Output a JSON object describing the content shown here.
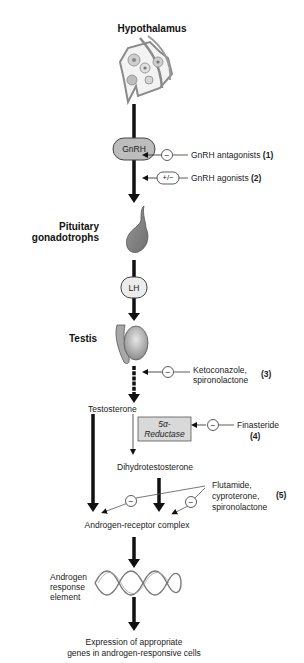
{
  "diagram": {
    "stages": {
      "hypothalamus": "Hypothalamus",
      "gnrh": "GnRH",
      "pituitary_line1": "Pituitary",
      "pituitary_line2": "gonadotrophs",
      "lh": "LH",
      "testis": "Testis",
      "testosterone": "Testosterone",
      "reductase_line1": "5α-",
      "reductase_line2": "Reductase",
      "dht": "Dihydrotestosterone",
      "arc": "Androgen-receptor complex",
      "are_line1": "Androgen",
      "are_line2": "response",
      "are_line3": "element",
      "expression_line1": "Expression of appropriate",
      "expression_line2": "genes in androgen-responsive cells"
    },
    "inhibitors": [
      {
        "symbol": "−",
        "label": "GnRH antagonists",
        "number": "(1)"
      },
      {
        "symbol": "+/−",
        "label": "GnRH agonists",
        "number": "(2)"
      },
      {
        "symbol": "−",
        "label_line1": "Ketoconazole,",
        "label_line2": "spironolactone",
        "number": "(3)"
      },
      {
        "symbol": "−",
        "label": "Finasteride",
        "number": "(4)"
      },
      {
        "symbol": "−",
        "label_line1": "Flutamide,",
        "label_line2": "cyproterone,",
        "label_line3": "spironolactone",
        "number": "(5)"
      }
    ],
    "colors": {
      "arrow": "#111111",
      "organ_fill": "#8a8a8a",
      "box_fill": "#d9d9d9",
      "pill_fill": "#bdbdbd"
    }
  }
}
